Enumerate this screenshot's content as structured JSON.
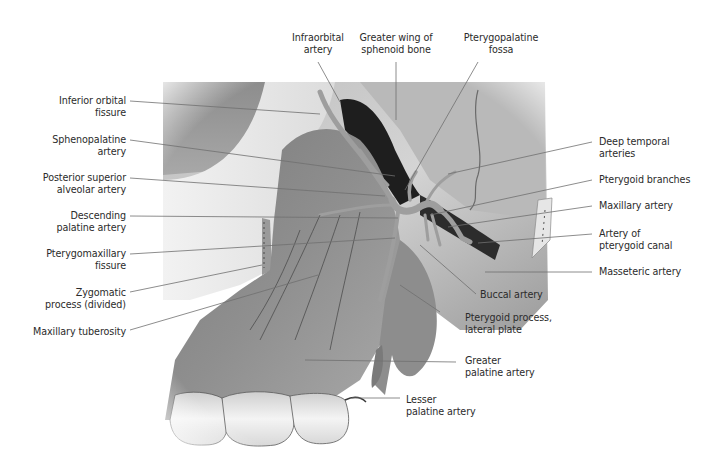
{
  "figure": {
    "colors": {
      "background": "#ffffff",
      "label_text": "#2b2b2b",
      "leader_line": "#6e6e6e",
      "bone_light": "#e6e6e6",
      "bone_mid": "#a9a9a9",
      "bone_dark": "#5a5a5a",
      "fossa_dark": "#1e1e1e",
      "artery": "#9a9a9a"
    }
  },
  "labels": {
    "left": [
      {
        "id": "inferior-orbital-fissure",
        "lines": [
          "Inferior orbital",
          "fissure"
        ]
      },
      {
        "id": "sphenopalatine-artery",
        "lines": [
          "Sphenopalatine",
          "artery"
        ]
      },
      {
        "id": "posterior-superior-alveolar-artery",
        "lines": [
          "Posterior superior",
          "alveolar artery"
        ]
      },
      {
        "id": "descending-palatine-artery",
        "lines": [
          "Descending",
          "palatine artery"
        ]
      },
      {
        "id": "pterygomaxillary-fissure",
        "lines": [
          "Pterygomaxillary",
          "fissure"
        ]
      },
      {
        "id": "zygomatic-process",
        "lines": [
          "Zygomatic",
          "process (divided)"
        ]
      },
      {
        "id": "maxillary-tuberosity",
        "lines": [
          "Maxillary tuberosity"
        ]
      }
    ],
    "top": [
      {
        "id": "infraorbital-artery",
        "lines": [
          "Infraorbital",
          "artery"
        ]
      },
      {
        "id": "greater-wing-sphenoid",
        "lines": [
          "Greater wing of",
          "sphenoid bone"
        ]
      },
      {
        "id": "pterygopalatine-fossa",
        "lines": [
          "Pterygopalatine",
          "fossa"
        ]
      }
    ],
    "right": [
      {
        "id": "deep-temporal-arteries",
        "lines": [
          "Deep temporal",
          "arteries"
        ]
      },
      {
        "id": "pterygoid-branches",
        "lines": [
          "Pterygoid branches"
        ]
      },
      {
        "id": "maxillary-artery",
        "lines": [
          "Maxillary artery"
        ]
      },
      {
        "id": "artery-pterygoid-canal",
        "lines": [
          "Artery of",
          "pterygoid canal"
        ]
      },
      {
        "id": "masseteric-artery",
        "lines": [
          "Masseteric artery"
        ]
      }
    ],
    "bottom": [
      {
        "id": "buccal-artery",
        "lines": [
          "Buccal artery"
        ]
      },
      {
        "id": "pterygoid-process-lateral-plate",
        "lines": [
          "Pterygoid process,",
          "lateral plate"
        ]
      },
      {
        "id": "greater-palatine-artery",
        "lines": [
          "Greater",
          "palatine artery"
        ]
      },
      {
        "id": "lesser-palatine-artery",
        "lines": [
          "Lesser",
          "palatine artery"
        ]
      }
    ]
  }
}
